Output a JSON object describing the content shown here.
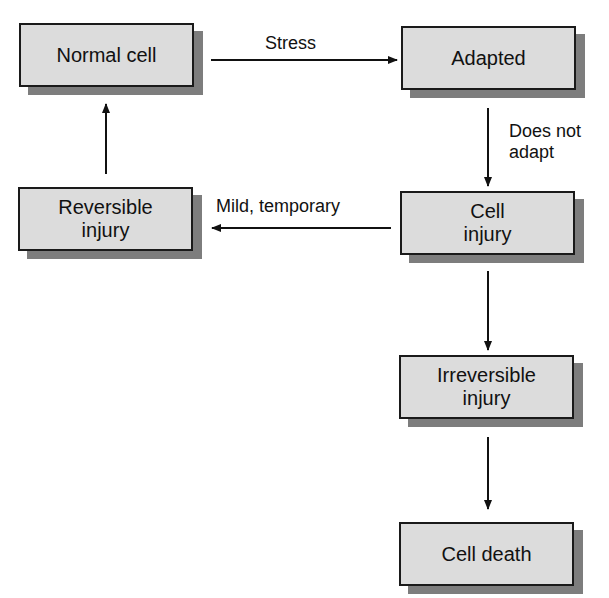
{
  "diagram": {
    "type": "flowchart",
    "nodes": [
      {
        "id": "normal",
        "label": "Normal cell"
      },
      {
        "id": "adapted",
        "label": "Adapted"
      },
      {
        "id": "cell_injury",
        "label": "Cell\ninjury"
      },
      {
        "id": "reversible",
        "label": "Reversible\ninjury"
      },
      {
        "id": "irreversible",
        "label": "Irreversible\ninjury"
      },
      {
        "id": "death",
        "label": "Cell death"
      }
    ],
    "edges": [
      {
        "from": "normal",
        "to": "adapted",
        "label": "Stress"
      },
      {
        "from": "adapted",
        "to": "cell_injury",
        "label": "Does not\nadapt"
      },
      {
        "from": "cell_injury",
        "to": "reversible",
        "label": "Mild, temporary"
      },
      {
        "from": "reversible",
        "to": "normal",
        "label": ""
      },
      {
        "from": "cell_injury",
        "to": "irreversible",
        "label": ""
      },
      {
        "from": "irreversible",
        "to": "death",
        "label": ""
      }
    ]
  },
  "labels": {
    "normal_cell": "Normal cell",
    "adapted": "Adapted",
    "cell_injury_1": "Cell",
    "cell_injury_2": "injury",
    "reversible_1": "Reversible",
    "reversible_2": "injury",
    "irreversible_1": "Irreversible",
    "irreversible_2": "injury",
    "cell_death": "Cell death",
    "stress": "Stress",
    "does_not_1": "Does not",
    "does_not_2": "adapt",
    "mild_temporary": "Mild, temporary"
  },
  "colors": {
    "box_fill": "#dcdcdc",
    "box_border": "#1a1a1a",
    "shadow": "#7d7d7d",
    "arrow": "#111111"
  }
}
